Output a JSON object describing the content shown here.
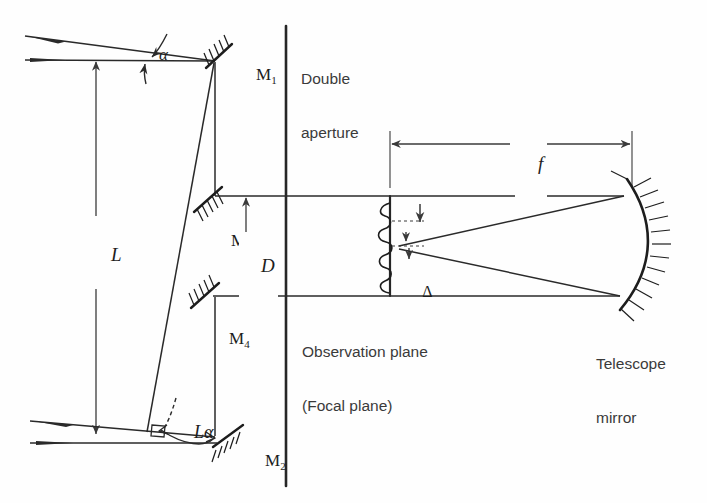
{
  "figure": {
    "background": "#fefefe",
    "ink": "#1d1d1d"
  },
  "labels": {
    "double_aperture_line1": "Double",
    "double_aperture_line2": "aperture",
    "observation_plane_line1": "Observation plane",
    "observation_plane_line2": "(Focal plane)",
    "telescope_mirror_line1": "Telescope",
    "telescope_mirror_line2": "mirror"
  },
  "mirrors": [
    {
      "id": "M1",
      "label": "M",
      "subscript": "1"
    },
    {
      "id": "M2",
      "label": "M",
      "subscript": "2"
    },
    {
      "id": "M3",
      "label": "M",
      "subscript": "3"
    },
    {
      "id": "M4",
      "label": "M",
      "subscript": "4"
    }
  ],
  "dimensions": [
    {
      "id": "L",
      "symbol": "L",
      "orientation": "vertical",
      "description": "baseline separation between M1 and M2"
    },
    {
      "id": "D",
      "symbol": "D",
      "orientation": "vertical",
      "description": "separation of the two beams at the double aperture"
    },
    {
      "id": "f",
      "symbol": "f",
      "orientation": "horizontal",
      "description": "telescope focal length"
    },
    {
      "id": "La",
      "symbol": "Lα",
      "orientation": "arc",
      "description": "path difference between the two arms"
    },
    {
      "id": "alpha",
      "symbol": "α",
      "orientation": "angle",
      "description": "angular separation of the two incoming wavefronts"
    },
    {
      "id": "Delta",
      "symbol": "Δ",
      "orientation": "vertical",
      "description": "interference fringe spacing in the focal plane"
    }
  ],
  "colors": {
    "ink": "#1d1d1d",
    "ray": "#2a2a2a",
    "text": "#3a3a3a",
    "dimension": "#3a3a3a"
  }
}
